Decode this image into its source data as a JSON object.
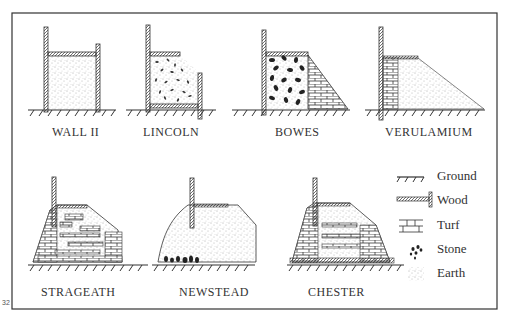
{
  "figure": {
    "page_number": "32",
    "panels": [
      {
        "id": "wall-ii",
        "label": "WALL II"
      },
      {
        "id": "lincoln",
        "label": "LINCOLN"
      },
      {
        "id": "bowes",
        "label": "BOWES"
      },
      {
        "id": "verulamium",
        "label": "VERULAMIUM"
      },
      {
        "id": "strageath",
        "label": "STRAGEATH"
      },
      {
        "id": "newstead",
        "label": "NEWSTEAD"
      },
      {
        "id": "chester",
        "label": "CHESTER"
      }
    ],
    "legend": [
      {
        "icon": "ground-icon",
        "label": "Ground"
      },
      {
        "icon": "wood-icon",
        "label": "Wood"
      },
      {
        "icon": "turf-icon",
        "label": "Turf"
      },
      {
        "icon": "stone-icon",
        "label": "Stone"
      },
      {
        "icon": "earth-icon",
        "label": "Earth"
      }
    ],
    "colors": {
      "ink": "#2a2a2a",
      "paper": "#ffffff"
    }
  }
}
